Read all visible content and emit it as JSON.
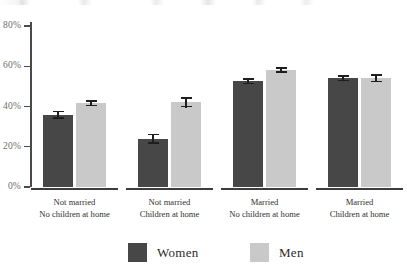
{
  "chart_data": {
    "type": "bar",
    "title": "",
    "subtitle": "",
    "xlabel": "",
    "ylabel": "",
    "ylim": [
      0,
      80
    ],
    "grid": false,
    "legend_position": "bottom-center",
    "y_ticks": [
      "0%",
      "20%",
      "40%",
      "60%",
      "80%"
    ],
    "y_tick_values": [
      0,
      20,
      40,
      60,
      80
    ],
    "categories": [
      "Not married\nNo children at home",
      "Not married\nChildren at home",
      "Married\nNo children at home",
      "Married\nChildren at home"
    ],
    "category_lines": [
      [
        "Not married",
        "No children at home"
      ],
      [
        "Not married",
        "Children at home"
      ],
      [
        "Married",
        "No children at home"
      ],
      [
        "Married",
        "Children at home"
      ]
    ],
    "series": [
      {
        "name": "Women",
        "color": "#474747",
        "values": [
          36,
          24,
          52.5,
          54
        ],
        "errors": [
          2,
          2.5,
          1.5,
          1.5
        ]
      },
      {
        "name": "Men",
        "color": "#c9c9c9",
        "values": [
          41.5,
          42,
          58,
          54
        ],
        "errors": [
          1.5,
          2.5,
          1.5,
          2
        ]
      }
    ]
  },
  "legend": {
    "items": [
      {
        "label": "Women",
        "color": "#474747"
      },
      {
        "label": "Men",
        "color": "#c9c9c9"
      }
    ]
  },
  "axis": {
    "y_labels": [
      "80%",
      "60%",
      "40%",
      "20%",
      "0%"
    ]
  },
  "colors": {
    "women": "#474747",
    "men": "#c9c9c9",
    "axis": "#4a4a4a",
    "error": "#1e1e1e",
    "tick_text": "#6d6d6d",
    "label_text": "#2f2f2f",
    "background": "#ffffff"
  }
}
